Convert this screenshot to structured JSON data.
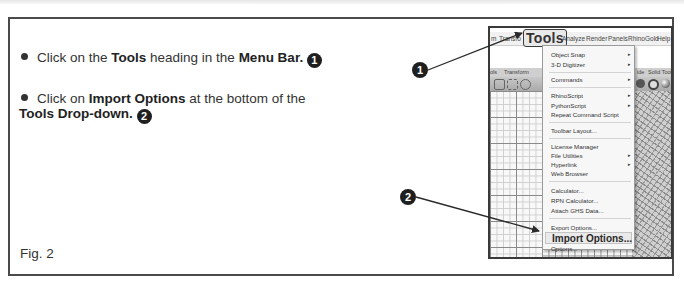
{
  "instructions": {
    "step1": {
      "prefix": "Click on the ",
      "bold1": "Tools",
      "mid": " heading in the ",
      "bold2": "Menu Bar.",
      "badge": "1"
    },
    "step2": {
      "prefix": "Click on ",
      "bold1": "Import Options",
      "mid": " at the bottom of the",
      "bold2": "Tools Drop-down.",
      "badge": "2"
    }
  },
  "figure_label": "Fig. 2",
  "callouts": {
    "one": "1",
    "two": "2"
  },
  "screenshot": {
    "menubar": {
      "items": [
        "m",
        "Transfo",
        "Tools",
        "Analyze",
        "Render",
        "Panels",
        "RhinoGold",
        "Help"
      ],
      "highlighted": "Tools"
    },
    "tabs": [
      "ols",
      "Transform",
      "ide",
      "Solid Tools"
    ],
    "dropdown": {
      "items": [
        {
          "label": "Object Snap",
          "submenu": true
        },
        {
          "label": "3-D Digitizer",
          "submenu": true
        },
        {
          "label": "Commands",
          "submenu": true
        },
        {
          "label": "RhinoScript",
          "submenu": true
        },
        {
          "label": "PythonScript",
          "submenu": true
        },
        {
          "label": "Repeat Command Script",
          "submenu": false
        },
        {
          "label": "Toolbar Layout...",
          "submenu": false
        },
        {
          "label": "License Manager",
          "submenu": false
        },
        {
          "label": "File Utilities",
          "submenu": true
        },
        {
          "label": "Hyperlink",
          "submenu": true
        },
        {
          "label": "Web Browser",
          "submenu": false
        },
        {
          "label": "Calculator...",
          "submenu": false
        },
        {
          "label": "RPN Calculator...",
          "submenu": false
        },
        {
          "label": "Attach GHS Data...",
          "submenu": false
        },
        {
          "label": "Export Options...",
          "submenu": false
        },
        {
          "label": "Import Options...",
          "submenu": false,
          "highlighted": true
        },
        {
          "label": "Options...",
          "submenu": false
        }
      ],
      "submenu_arrow": "▸"
    }
  },
  "colors": {
    "frame_border": "#4a4a4a",
    "callout_fill": "#1f1f1f",
    "text": "#333333"
  }
}
